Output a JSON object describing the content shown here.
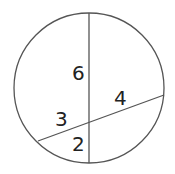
{
  "diagram": {
    "type": "intersecting-chords-in-circle",
    "stroke_color": "#555555",
    "text_color": "#222222",
    "labels": {
      "upper_vertical_segment": "6",
      "right_chord_segment": "4",
      "left_chord_segment": "3",
      "lower_vertical_segment": "2"
    }
  }
}
